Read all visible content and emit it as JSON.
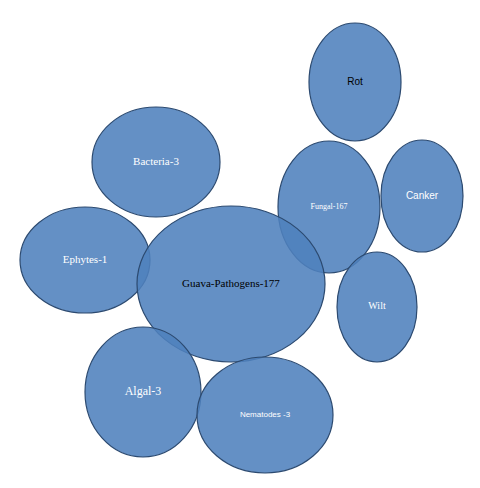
{
  "diagram": {
    "type": "bubble-cluster",
    "fill_color": "#4f81bd",
    "stroke_color": "#2c4a70",
    "nodes": [
      {
        "id": "rot",
        "label": "Rot",
        "cx": 355,
        "cy": 82,
        "rx": 46,
        "ry": 59,
        "text_color": "#000000",
        "font": "sans",
        "size": 10
      },
      {
        "id": "bacteria",
        "label": "Bacteria-3",
        "cx": 156,
        "cy": 162,
        "rx": 64,
        "ry": 55,
        "text_color": "#ffffff",
        "font": "serif",
        "size": 11
      },
      {
        "id": "fungal",
        "label": "Fungal-167",
        "cx": 329,
        "cy": 207,
        "rx": 51,
        "ry": 66,
        "text_color": "#ffffff",
        "font": "serif",
        "size": 8
      },
      {
        "id": "canker",
        "label": "Canker",
        "cx": 422,
        "cy": 196,
        "rx": 41,
        "ry": 56,
        "text_color": "#ffffff",
        "font": "sans",
        "size": 10
      },
      {
        "id": "ephytes",
        "label": "Ephytes-1",
        "cx": 85,
        "cy": 260,
        "rx": 65,
        "ry": 53,
        "text_color": "#ffffff",
        "font": "serif",
        "size": 11
      },
      {
        "id": "guava",
        "label": "Guava-Pathogens-177",
        "cx": 231,
        "cy": 284,
        "rx": 94,
        "ry": 78,
        "text_color": "#000000",
        "font": "serif",
        "size": 11
      },
      {
        "id": "wilt",
        "label": "Wilt",
        "cx": 377,
        "cy": 307,
        "rx": 40,
        "ry": 55,
        "text_color": "#ffffff",
        "font": "serif",
        "size": 10
      },
      {
        "id": "algal",
        "label": "Algal-3",
        "cx": 143,
        "cy": 392,
        "rx": 58,
        "ry": 65,
        "text_color": "#ffffff",
        "font": "serif",
        "size": 12
      },
      {
        "id": "nematodes",
        "label": "Nematodes -3",
        "cx": 265,
        "cy": 415,
        "rx": 68,
        "ry": 58,
        "text_color": "#ffffff",
        "font": "sans",
        "size": 8
      }
    ],
    "hierarchy": {
      "root": "Guava-Pathogens-177",
      "children": [
        "Bacteria-3",
        "Ephytes-1",
        "Fungal-167",
        "Algal-3",
        "Nematodes -3"
      ],
      "fungal_children": [
        "Rot",
        "Canker",
        "Wilt"
      ]
    }
  }
}
